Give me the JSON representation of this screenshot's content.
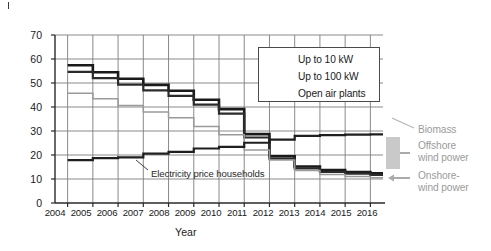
{
  "chart_data": {
    "type": "line",
    "title": "",
    "xlabel": "Year",
    "ylabel": "Feed-in tariff and price respectively (¢ (kW h)⁻¹)",
    "xlim": [
      2003.5,
      2016.5
    ],
    "ylim": [
      0,
      70
    ],
    "yticks": [
      0,
      10,
      20,
      30,
      40,
      50,
      60,
      70
    ],
    "xticks": [
      2004,
      2005,
      2006,
      2007,
      2008,
      2009,
      2010,
      2011,
      2012,
      2013,
      2014,
      2015,
      2016
    ],
    "grid": true,
    "legend_position": "upper right",
    "x": [
      2004,
      2005,
      2006,
      2007,
      2008,
      2009,
      2010,
      2011,
      2012,
      2013,
      2014,
      2015,
      2016
    ],
    "series": [
      {
        "name": "Up to 10 kW",
        "color": "#1a1a1a",
        "values": [
          57.4,
          54.5,
          51.8,
          49.2,
          46.8,
          43.0,
          39.1,
          28.7,
          19.5,
          15.2,
          13.7,
          12.9,
          12.4
        ]
      },
      {
        "name": "Up to 100 kW",
        "color": "#2b2b2b",
        "values": [
          54.6,
          52.0,
          49.3,
          46.9,
          44.6,
          41.0,
          37.2,
          27.3,
          18.5,
          14.4,
          13.0,
          12.2,
          11.7
        ]
      },
      {
        "name": "Open air plants",
        "color": "#9a9a9a",
        "values": [
          45.7,
          43.4,
          40.6,
          37.9,
          35.5,
          31.9,
          28.4,
          22.1,
          17.9,
          13.5,
          11.9,
          11.0,
          10.5
        ]
      },
      {
        "name": "Electricity price households",
        "color": "#1f1f1f",
        "values": [
          17.9,
          18.7,
          19.0,
          20.6,
          21.3,
          22.7,
          23.4,
          25.1,
          26.4,
          28.0,
          28.3,
          28.5,
          28.6
        ]
      }
    ],
    "annotations": [
      {
        "label": "Electricity price households",
        "kind": "inline-callout"
      },
      {
        "label": "Biomass",
        "kind": "right-arrow-label"
      },
      {
        "label": "Offshore wind power",
        "kind": "right-arrow-label"
      },
      {
        "label": "Onshore-wind power",
        "kind": "right-arrow-label"
      }
    ]
  },
  "legend": {
    "items": [
      {
        "label": "Up to 10 kW",
        "color": "#1a1a1a",
        "width": 2.6
      },
      {
        "label": "Up to 100 kW",
        "color": "#2b2b2b",
        "width": 2.2
      },
      {
        "label": "Open air plants",
        "color": "#9a9a9a",
        "width": 1.6
      }
    ]
  },
  "axes": {
    "ylabel_main": "Feed-in tariff and price respectively (¢ (kW h)",
    "ylabel_exp": "−1",
    "ylabel_close": ")",
    "xlabel": "Year",
    "yticks": [
      "0",
      "10",
      "20",
      "30",
      "40",
      "50",
      "60",
      "70"
    ],
    "xticks": [
      "2004",
      "2005",
      "2006",
      "2007",
      "2008",
      "2009",
      "2010",
      "2011",
      "2012",
      "2013",
      "2014",
      "2015",
      "2016"
    ]
  },
  "annotations": {
    "inline": "Electricity price households",
    "biomass": "Biomass",
    "offshore_line1": "Offshore",
    "offshore_line2": "wind power",
    "onshore_line1": "Onshore-",
    "onshore_line2": "wind power"
  },
  "colors": {
    "grid": "#7d7d7d",
    "axis": "#2a2a2a",
    "series_dark": "#1a1a1a",
    "series_mid": "#2b2b2b",
    "series_gray": "#9a9a9a",
    "annotation_gray": "#9b9b9b",
    "arrow_block": "#c9c9c9"
  }
}
